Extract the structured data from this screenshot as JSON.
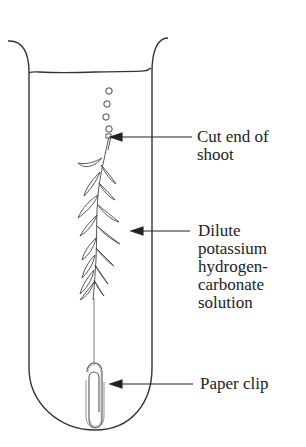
{
  "diagram": {
    "type": "experimental apparatus",
    "components": [
      "test-tube",
      "liquid-surface",
      "oxygen-bubbles",
      "pondweed-shoot",
      "thread",
      "paper-clip"
    ],
    "colors": {
      "line": "#333333",
      "text": "#222222",
      "background": "#ffffff"
    }
  },
  "labels": {
    "cut_end": {
      "lines": [
        "Cut end of",
        "shoot"
      ]
    },
    "solution": {
      "lines": [
        "Dilute",
        "potassium",
        "hydrogen-",
        "carbonate",
        "solution"
      ]
    },
    "paper_clip": {
      "lines": [
        "Paper clip"
      ]
    }
  }
}
